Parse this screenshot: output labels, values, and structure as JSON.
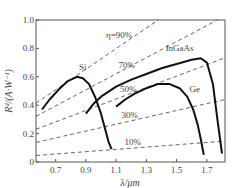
{
  "chart_data": {
    "type": "line",
    "title": "",
    "xlabel": "λ/μm",
    "ylabel": "R_d/(A·W⁻¹)",
    "xlim": [
      0.57,
      1.82
    ],
    "ylim": [
      0,
      1.0
    ],
    "x_ticks": [
      0.7,
      0.9,
      1.1,
      1.3,
      1.5,
      1.7
    ],
    "x_tick_labels": [
      "0.7",
      "0.9",
      "1.1",
      "1.3",
      "1.5",
      "1.7"
    ],
    "y_ticks": [
      0,
      0.2,
      0.4,
      0.6,
      0.8,
      1.0
    ],
    "y_tick_labels": [
      "0",
      "0.2",
      "0.4",
      "0.6",
      "0.8",
      "1.0"
    ],
    "grid": false,
    "legend": "inline labels",
    "series": [
      {
        "name": "Si",
        "style": "solid",
        "label_pos": [
          0.88,
          0.65
        ],
        "x": [
          0.61,
          0.66,
          0.72,
          0.78,
          0.84,
          0.88,
          0.92,
          0.96,
          1.0,
          1.03,
          1.05,
          1.07
        ],
        "y": [
          0.37,
          0.44,
          0.51,
          0.57,
          0.6,
          0.59,
          0.55,
          0.46,
          0.34,
          0.22,
          0.14,
          0.09
        ]
      },
      {
        "name": "InGaAs",
        "style": "solid",
        "label_pos": [
          1.52,
          0.78
        ],
        "x": [
          0.9,
          0.95,
          1.0,
          1.1,
          1.2,
          1.3,
          1.4,
          1.5,
          1.6,
          1.66,
          1.7,
          1.74,
          1.77,
          1.8
        ],
        "y": [
          0.34,
          0.41,
          0.46,
          0.53,
          0.58,
          0.62,
          0.66,
          0.69,
          0.72,
          0.73,
          0.7,
          0.55,
          0.3,
          0.06
        ]
      },
      {
        "name": "Ge",
        "style": "solid",
        "label_pos": [
          1.62,
          0.49
        ],
        "x": [
          1.1,
          1.16,
          1.22,
          1.3,
          1.38,
          1.45,
          1.52,
          1.57,
          1.61,
          1.64,
          1.66,
          1.68
        ],
        "y": [
          0.39,
          0.44,
          0.48,
          0.52,
          0.55,
          0.55,
          0.52,
          0.46,
          0.37,
          0.26,
          0.16,
          0.05
        ]
      },
      {
        "name": "η=90%",
        "style": "dashed",
        "label": "η=90%",
        "label_pos": [
          1.12,
          0.87
        ],
        "x": [
          0.57,
          1.378
        ],
        "y": [
          0.414,
          1.0
        ]
      },
      {
        "name": "70%",
        "style": "dashed",
        "label": "70%",
        "label_pos": [
          1.17,
          0.66
        ],
        "x": [
          0.57,
          1.77
        ],
        "y": [
          0.322,
          1.0
        ]
      },
      {
        "name": "50%",
        "style": "dashed",
        "label": "50%",
        "label_pos": [
          1.18,
          0.49
        ],
        "x": [
          0.57,
          1.82
        ],
        "y": [
          0.23,
          0.734
        ]
      },
      {
        "name": "30%",
        "style": "dashed",
        "label": "30%",
        "label_pos": [
          1.19,
          0.31
        ],
        "x": [
          0.57,
          1.82
        ],
        "y": [
          0.138,
          0.44
        ]
      },
      {
        "name": "10%",
        "style": "dashed",
        "label": "10%",
        "label_pos": [
          1.21,
          0.12
        ],
        "x": [
          0.57,
          1.82
        ],
        "y": [
          0.046,
          0.147
        ]
      }
    ]
  }
}
